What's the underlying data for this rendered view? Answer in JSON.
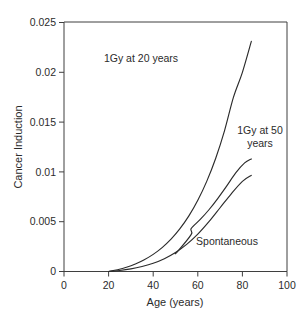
{
  "chart_data": {
    "type": "line",
    "title": "",
    "xlabel": "Age (years)",
    "ylabel": "Cancer Induction",
    "xlim": [
      0,
      100
    ],
    "ylim": [
      0,
      0.025
    ],
    "xticks": [
      0,
      20,
      40,
      60,
      80,
      100
    ],
    "xtick_labels": [
      "0",
      "20",
      "40",
      "60",
      "80",
      "100"
    ],
    "yticks": [
      0,
      0.005,
      0.01,
      0.015,
      0.02,
      0.025
    ],
    "ytick_labels": [
      "0",
      "0.005",
      "0.01",
      "0.015",
      "0.02",
      "0.025"
    ],
    "grid": false,
    "legend": "annotations-inline",
    "series": [
      {
        "name": "1Gy at 20 years",
        "label_text": "1Gy at 20 years",
        "x": [
          20,
          24,
          28,
          32,
          36,
          40,
          44,
          48,
          52,
          56,
          60,
          64,
          68,
          72,
          76,
          80,
          84
        ],
        "y": [
          0.0,
          0.00018,
          0.00042,
          0.00075,
          0.00118,
          0.00172,
          0.0024,
          0.00325,
          0.0043,
          0.00558,
          0.00715,
          0.00905,
          0.01135,
          0.01415,
          0.0175,
          0.02,
          0.0231
        ]
      },
      {
        "name": "1Gy at 50 years",
        "label_text": "1Gy at 50 years",
        "x": [
          50,
          50.5,
          57,
          57,
          61,
          65,
          69,
          73,
          77,
          81,
          84
        ],
        "y": [
          0.0019,
          0.0019,
          0.0037,
          0.0043,
          0.0052,
          0.0062,
          0.00735,
          0.0086,
          0.0099,
          0.0109,
          0.0113
        ]
      },
      {
        "name": "Spontaneous",
        "label_text": "Spontaneous",
        "x": [
          20,
          25,
          30,
          35,
          40,
          45,
          50,
          55,
          60,
          65,
          70,
          75,
          80,
          84
        ],
        "y": [
          0.0,
          0.0001,
          0.00026,
          0.0005,
          0.00082,
          0.00128,
          0.0019,
          0.00272,
          0.00375,
          0.005,
          0.0064,
          0.0078,
          0.00905,
          0.00965
        ]
      }
    ],
    "annotations": [
      {
        "text": "1Gy at 20 years",
        "x": 41,
        "y": 0.0213
      },
      {
        "text": "1Gy at 50",
        "x": 77,
        "y": 0.014
      },
      {
        "text": "years",
        "x": 77,
        "y": 0.0127
      },
      {
        "text": "Spontaneous",
        "x": 73,
        "y": 0.0026
      }
    ]
  },
  "axes": {
    "y_title": "Cancer Induction",
    "x_title": "Age (years)"
  }
}
